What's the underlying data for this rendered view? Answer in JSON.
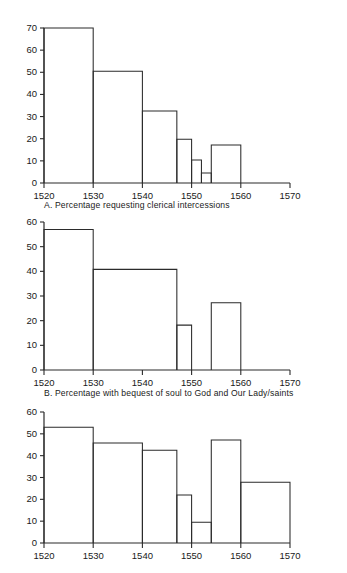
{
  "figure": {
    "title": "",
    "background": "#ffffff",
    "line_color": "#2b2b2b"
  },
  "panels": [
    {
      "id": "A",
      "caption": "A. Percentage requesting clerical intercessions",
      "chart_data": {
        "type": "bar",
        "title": "A. Percentage requesting clerical intercessions",
        "xlabel": "",
        "ylabel": "",
        "xlim": [
          1520,
          1570
        ],
        "ylim": [
          0,
          70
        ],
        "yticks": [
          0,
          10,
          20,
          30,
          40,
          50,
          60,
          70
        ],
        "xticks": [
          1520,
          1530,
          1540,
          1550,
          1560,
          1570
        ],
        "grid": false,
        "legend": "none",
        "bins": [
          {
            "start": 1520,
            "end": 1530,
            "value": 70
          },
          {
            "start": 1530,
            "end": 1540,
            "value": 50.5
          },
          {
            "start": 1540,
            "end": 1547,
            "value": 32.5
          },
          {
            "start": 1547,
            "end": 1550,
            "value": 19.8
          },
          {
            "start": 1550,
            "end": 1552,
            "value": 10.4
          },
          {
            "start": 1552,
            "end": 1554,
            "value": 4.5
          },
          {
            "start": 1554,
            "end": 1560,
            "value": 17.2
          }
        ]
      }
    },
    {
      "id": "B",
      "caption": "B. Percentage with bequest of soul to God and Our Lady/saints",
      "chart_data": {
        "type": "bar",
        "title": "B. Percentage with bequest of soul to God and Our Lady/saints",
        "xlabel": "",
        "ylabel": "",
        "xlim": [
          1520,
          1570
        ],
        "ylim": [
          0,
          60
        ],
        "yticks": [
          0,
          10,
          20,
          30,
          40,
          50,
          60
        ],
        "xticks": [
          1520,
          1530,
          1540,
          1550,
          1560,
          1570
        ],
        "grid": false,
        "legend": "none",
        "bins": [
          {
            "start": 1520,
            "end": 1530,
            "value": 57
          },
          {
            "start": 1530,
            "end": 1547,
            "value": 40.8
          },
          {
            "start": 1547,
            "end": 1550,
            "value": 18.2
          },
          {
            "start": 1554,
            "end": 1560,
            "value": 27.3
          }
        ]
      }
    },
    {
      "id": "C",
      "caption": "",
      "chart_data": {
        "type": "bar",
        "title": "",
        "xlabel": "",
        "ylabel": "",
        "xlim": [
          1520,
          1570
        ],
        "ylim": [
          0,
          60
        ],
        "yticks": [
          0,
          10,
          20,
          30,
          40,
          50,
          60
        ],
        "xticks": [
          1520,
          1530,
          1540,
          1550,
          1560,
          1570
        ],
        "grid": false,
        "legend": "none",
        "bins": [
          {
            "start": 1520,
            "end": 1530,
            "value": 53
          },
          {
            "start": 1530,
            "end": 1540,
            "value": 45.8
          },
          {
            "start": 1540,
            "end": 1547,
            "value": 42.5
          },
          {
            "start": 1547,
            "end": 1550,
            "value": 22
          },
          {
            "start": 1550,
            "end": 1554,
            "value": 9.5
          },
          {
            "start": 1554,
            "end": 1560,
            "value": 47.2
          },
          {
            "start": 1560,
            "end": 1570,
            "value": 27.8
          }
        ]
      }
    }
  ]
}
